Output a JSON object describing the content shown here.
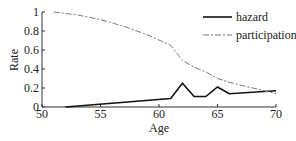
{
  "chart_data": {
    "type": "line",
    "title": "",
    "xlabel": "Age",
    "ylabel": "Rate",
    "xlim": [
      50,
      70
    ],
    "ylim": [
      0,
      1
    ],
    "xticks": [
      50,
      55,
      60,
      65,
      70
    ],
    "yticks": [
      0,
      0.2,
      0.4,
      0.6,
      0.8,
      1
    ],
    "xtick_labels": [
      "50",
      "55",
      "60",
      "65",
      "70"
    ],
    "ytick_labels": [
      "0",
      "0.2",
      "0.4",
      "0.6",
      "0.8",
      "1"
    ],
    "grid": false,
    "legend_position": "upper right",
    "series": [
      {
        "name": "hazard",
        "style": "solid",
        "color": "#111111",
        "x": [
          52,
          61,
          62,
          63,
          64,
          65,
          66,
          70
        ],
        "y": [
          0.0,
          0.09,
          0.25,
          0.11,
          0.11,
          0.21,
          0.14,
          0.17
        ]
      },
      {
        "name": "participation",
        "style": "dash-dot",
        "color": "#777777",
        "x": [
          51,
          53,
          55,
          57,
          59,
          61,
          62,
          63,
          64,
          65,
          66,
          67,
          68,
          69,
          70
        ],
        "y": [
          1.0,
          0.97,
          0.92,
          0.85,
          0.76,
          0.65,
          0.49,
          0.42,
          0.37,
          0.3,
          0.26,
          0.23,
          0.2,
          0.17,
          0.14
        ]
      }
    ]
  },
  "legend": {
    "items": [
      {
        "label": "hazard"
      },
      {
        "label": "participation"
      }
    ]
  },
  "axes": {
    "xlabel": "Age",
    "ylabel": "Rate"
  }
}
